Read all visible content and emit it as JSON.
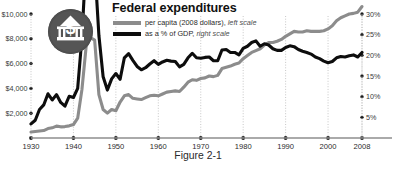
{
  "figure": {
    "title": "Federal expenditures",
    "caption": "Figure 2-1",
    "badge_icon": "dollar-capitol-badge-icon"
  },
  "legend": {
    "position": "top-left-inside",
    "items": [
      {
        "swatch_color": "#8c8c8c",
        "label_main": "per capita (2008 dollars),",
        "label_scale": "left scale",
        "series": "per_capita"
      },
      {
        "swatch_color": "#0d0d0d",
        "label_main": "as a % of GDP,",
        "label_scale": "right scale",
        "series": "pct_gdp"
      }
    ]
  },
  "axes": {
    "left": {
      "ticks": [
        "$2,000",
        "$4,000",
        "$6,000",
        "$8,000",
        "$10,000"
      ],
      "min": 0,
      "max": 10000
    },
    "right": {
      "ticks": [
        "5%",
        "10%",
        "15%",
        "20%",
        "25%",
        "30%"
      ],
      "min": 0,
      "max": 30
    },
    "bottom": {
      "ticks": [
        "1930",
        "1940",
        "1950",
        "1960",
        "1970",
        "1980",
        "1990",
        "2000",
        "2008"
      ],
      "min": 1930,
      "max": 2008
    }
  },
  "chart_data": {
    "type": "line",
    "title": "Federal expenditures",
    "xlabel": "",
    "ylabel": "per capita (2008 dollars)",
    "y2label": "as a % of GDP",
    "xlim": [
      1930,
      2008
    ],
    "ylim": [
      0,
      10000
    ],
    "y2lim": [
      0,
      30
    ],
    "grid": "vertical-dotted-at-decades",
    "legend_position": "top-left",
    "x": [
      1930,
      1931,
      1932,
      1933,
      1934,
      1935,
      1936,
      1937,
      1938,
      1939,
      1940,
      1941,
      1942,
      1943,
      1944,
      1945,
      1946,
      1947,
      1948,
      1949,
      1950,
      1951,
      1952,
      1953,
      1954,
      1955,
      1956,
      1957,
      1958,
      1959,
      1960,
      1961,
      1962,
      1963,
      1964,
      1965,
      1966,
      1967,
      1968,
      1969,
      1970,
      1971,
      1972,
      1973,
      1974,
      1975,
      1976,
      1977,
      1978,
      1979,
      1980,
      1981,
      1982,
      1983,
      1984,
      1985,
      1986,
      1987,
      1988,
      1989,
      1990,
      1991,
      1992,
      1993,
      1994,
      1995,
      1996,
      1997,
      1998,
      1999,
      2000,
      2001,
      2002,
      2003,
      2004,
      2005,
      2006,
      2007,
      2008
    ],
    "series": [
      {
        "name": "per capita (2008 dollars), left scale",
        "axis": "left",
        "color": "#8c8c8c",
        "units": "2008 dollars",
        "values": [
          480,
          520,
          560,
          600,
          760,
          820,
          960,
          900,
          920,
          980,
          1080,
          1600,
          3900,
          7400,
          8100,
          7900,
          3500,
          2300,
          2000,
          2300,
          2200,
          2900,
          3400,
          3500,
          3200,
          3150,
          3100,
          3250,
          3400,
          3450,
          3400,
          3550,
          3700,
          3750,
          3800,
          3750,
          4100,
          4500,
          4700,
          4650,
          4800,
          4850,
          5000,
          4950,
          5050,
          5600,
          5700,
          5800,
          5950,
          6050,
          6400,
          6650,
          6900,
          7050,
          7200,
          7500,
          7700,
          7700,
          7800,
          7950,
          8200,
          8400,
          8600,
          8550,
          8550,
          8650,
          8600,
          8600,
          8600,
          8650,
          8800,
          9050,
          9450,
          9700,
          9850,
          10000,
          10050,
          10150,
          10600
        ]
      },
      {
        "name": "as a % of GDP, right scale",
        "axis": "right",
        "color": "#0d0d0d",
        "units": "percent of GDP",
        "values": [
          3.4,
          4.3,
          6.9,
          8.0,
          10.7,
          9.2,
          10.5,
          8.6,
          7.7,
          10.1,
          9.8,
          12.0,
          24.3,
          43.6,
          43.7,
          41.9,
          24.8,
          14.8,
          11.6,
          14.3,
          15.6,
          14.2,
          19.4,
          20.4,
          18.8,
          17.3,
          16.5,
          17.0,
          17.9,
          18.7,
          17.8,
          18.4,
          18.8,
          18.6,
          18.5,
          17.2,
          17.8,
          19.4,
          20.5,
          19.4,
          19.3,
          19.5,
          19.6,
          18.7,
          18.7,
          21.3,
          21.4,
          20.7,
          20.7,
          20.1,
          21.7,
          22.2,
          23.1,
          23.5,
          22.2,
          22.8,
          22.5,
          21.6,
          21.2,
          21.2,
          21.9,
          22.3,
          22.1,
          21.4,
          21.0,
          20.7,
          20.3,
          19.6,
          19.2,
          18.6,
          18.2,
          18.5,
          19.4,
          19.7,
          19.6,
          19.9,
          20.1,
          19.6,
          20.7
        ]
      }
    ]
  }
}
